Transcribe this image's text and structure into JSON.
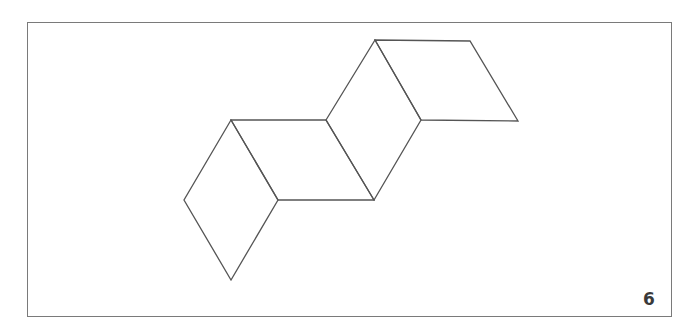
{
  "figure": {
    "stroke_color": "#555555",
    "shapes": [
      {
        "name": "rhombus-1",
        "points": [
          [
            231,
            120
          ],
          [
            184,
            200
          ],
          [
            231,
            280
          ],
          [
            278,
            200
          ]
        ]
      },
      {
        "name": "rhombus-2",
        "points": [
          [
            231,
            120
          ],
          [
            326,
            120
          ],
          [
            374,
            200
          ],
          [
            278,
            200
          ]
        ]
      },
      {
        "name": "rhombus-3",
        "points": [
          [
            326,
            120
          ],
          [
            375,
            40
          ],
          [
            421,
            120
          ],
          [
            374,
            200
          ]
        ]
      },
      {
        "name": "rhombus-4",
        "points": [
          [
            375,
            40
          ],
          [
            470,
            41
          ],
          [
            518,
            121
          ],
          [
            421,
            120
          ]
        ]
      }
    ]
  },
  "page_number": "6"
}
